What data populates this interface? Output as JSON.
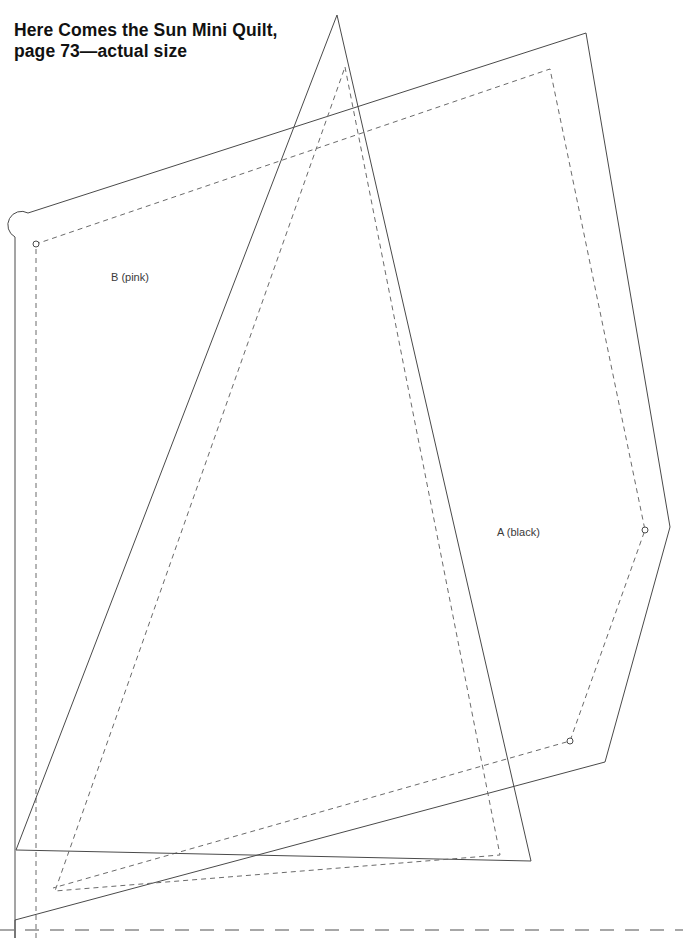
{
  "page": {
    "width": 683,
    "height": 938,
    "background_color": "#ffffff",
    "ink_color": "#4a4a4a",
    "title_color": "#111111"
  },
  "title": {
    "line1": "Here Comes the Sun Mini Quilt,",
    "line2": "page 73—actual size"
  },
  "labels": {
    "piece_a": "A (black)",
    "piece_b": "B (pink)"
  },
  "pattern": {
    "description": "Two overlapping quilt template pieces drawn as solid cutting lines with inner dashed seam lines, plus a dashed page-trim line along the bottom.",
    "pieces": [
      {
        "id": "A",
        "label": "A (black)",
        "label_position": [
          497,
          526
        ],
        "cut_line_style": "solid",
        "seam_line_style": "dashed",
        "cut_points": "17,237 17,225 29,213 586,33 670,527 605,762 15,920 15,237",
        "seam_points": "36,244 550,69 645,530 570,741 53,888 36,800",
        "corner_markers": [
          [
            36,
            244
          ],
          [
            645,
            530
          ],
          [
            570,
            741
          ]
        ]
      },
      {
        "id": "B",
        "label": "B (pink)",
        "label_position": [
          111,
          271
        ],
        "cut_line_style": "solid",
        "seam_line_style": "dashed",
        "cut_points": "337,15 531,861 16,850",
        "seam_points": "345,67 500,855 55,891",
        "corner_markers": []
      }
    ],
    "trim_line": {
      "style": "dashed",
      "orientation": "horizontal",
      "y": 930,
      "x_start": 0,
      "x_end": 683
    }
  }
}
